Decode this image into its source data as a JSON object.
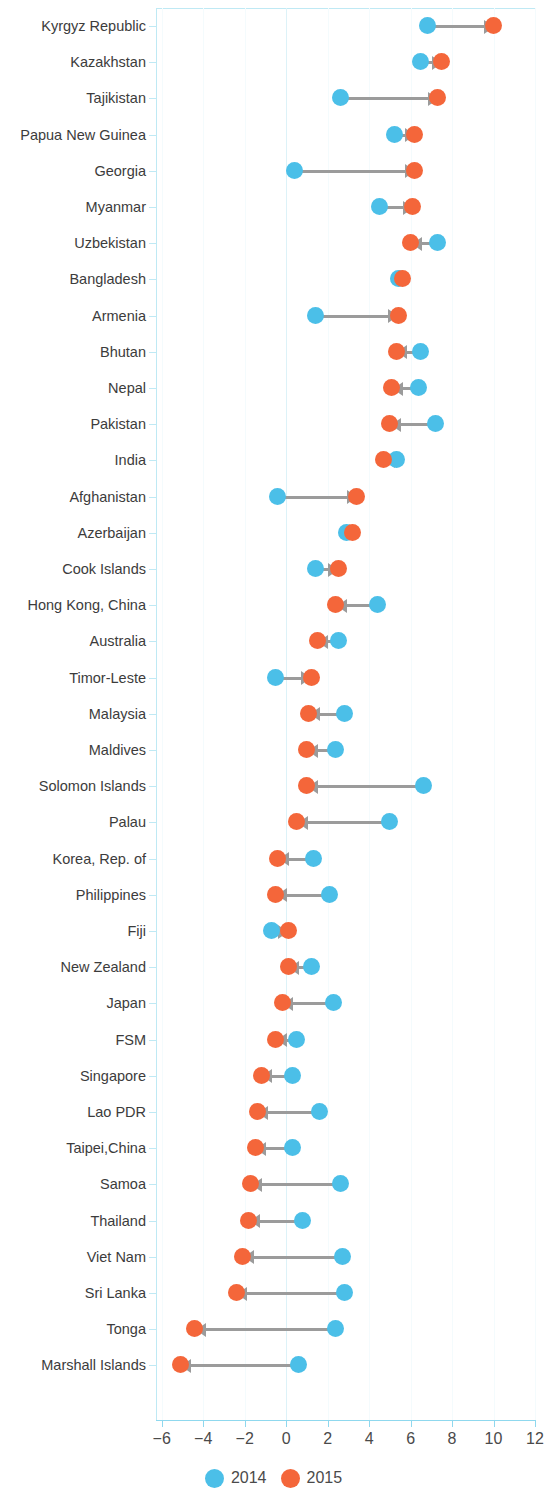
{
  "chart_data": {
    "type": "scatter",
    "subtype": "dumbbell-arrow-plot",
    "title": "",
    "xlabel": "",
    "ylabel": "",
    "xlim": [
      -6,
      12
    ],
    "xticks": [
      -6,
      -4,
      -2,
      0,
      2,
      4,
      6,
      8,
      10,
      12
    ],
    "xtick_labels": [
      "−6",
      "−4",
      "−2",
      "0",
      "2",
      "4",
      "6",
      "8",
      "10",
      "12"
    ],
    "grid": true,
    "legend_position": "bottom",
    "colors": {
      "2014": "#4bbfe8",
      "2015": "#f4663a",
      "arrow": "#9b9b9b",
      "axis": "#8fd8ee"
    },
    "legend": [
      {
        "label": "2014",
        "color": "#4bbfe8"
      },
      {
        "label": "2015",
        "color": "#f4663a"
      }
    ],
    "series": [
      {
        "name": "2014",
        "color": "#4bbfe8"
      },
      {
        "name": "2015",
        "color": "#f4663a"
      }
    ],
    "categories": [
      "Kyrgyz Republic",
      "Kazakhstan",
      "Tajikistan",
      "Papua New Guinea",
      "Georgia",
      "Myanmar",
      "Uzbekistan",
      "Bangladesh",
      "Armenia",
      "Bhutan",
      "Nepal",
      "Pakistan",
      "India",
      "Afghanistan",
      "Azerbaijan",
      "Cook Islands",
      "Hong Kong, China",
      "Australia",
      "Timor-Leste",
      "Malaysia",
      "Maldives",
      "Solomon Islands",
      "Palau",
      "Korea, Rep. of",
      "Philippines",
      "Fiji",
      "New Zealand",
      "Japan",
      "FSM",
      "Singapore",
      "Lao PDR",
      "Taipei,China",
      "Samoa",
      "Thailand",
      "Viet Nam",
      "Sri Lanka",
      "Tonga",
      "Marshall Islands"
    ],
    "points": [
      {
        "category": "Kyrgyz Republic",
        "v2014": 6.8,
        "v2015": 10.0
      },
      {
        "category": "Kazakhstan",
        "v2014": 6.5,
        "v2015": 7.5
      },
      {
        "category": "Tajikistan",
        "v2014": 2.6,
        "v2015": 7.3
      },
      {
        "category": "Papua New Guinea",
        "v2014": 5.2,
        "v2015": 6.2
      },
      {
        "category": "Georgia",
        "v2014": 0.4,
        "v2015": 6.2
      },
      {
        "category": "Myanmar",
        "v2014": 4.5,
        "v2015": 6.1
      },
      {
        "category": "Uzbekistan",
        "v2014": 7.3,
        "v2015": 6.0
      },
      {
        "category": "Bangladesh",
        "v2014": 5.4,
        "v2015": 5.6
      },
      {
        "category": "Armenia",
        "v2014": 1.4,
        "v2015": 5.4
      },
      {
        "category": "Bhutan",
        "v2014": 6.5,
        "v2015": 5.3
      },
      {
        "category": "Nepal",
        "v2014": 6.4,
        "v2015": 5.1
      },
      {
        "category": "Pakistan",
        "v2014": 7.2,
        "v2015": 5.0
      },
      {
        "category": "India",
        "v2014": 5.3,
        "v2015": 4.7
      },
      {
        "category": "Afghanistan",
        "v2014": -0.4,
        "v2015": 3.4
      },
      {
        "category": "Azerbaijan",
        "v2014": 2.9,
        "v2015": 3.2
      },
      {
        "category": "Cook Islands",
        "v2014": 1.4,
        "v2015": 2.5
      },
      {
        "category": "Hong Kong, China",
        "v2014": 4.4,
        "v2015": 2.4
      },
      {
        "category": "Australia",
        "v2014": 2.5,
        "v2015": 1.5
      },
      {
        "category": "Timor-Leste",
        "v2014": -0.5,
        "v2015": 1.2
      },
      {
        "category": "Malaysia",
        "v2014": 2.8,
        "v2015": 1.1
      },
      {
        "category": "Maldives",
        "v2014": 2.4,
        "v2015": 1.0
      },
      {
        "category": "Solomon Islands",
        "v2014": 6.6,
        "v2015": 1.0
      },
      {
        "category": "Palau",
        "v2014": 5.0,
        "v2015": 0.5
      },
      {
        "category": "Korea, Rep. of",
        "v2014": 1.3,
        "v2015": -0.4
      },
      {
        "category": "Philippines",
        "v2014": 2.1,
        "v2015": -0.5
      },
      {
        "category": "Fiji",
        "v2014": -0.7,
        "v2015": 0.1
      },
      {
        "category": "New Zealand",
        "v2014": 1.2,
        "v2015": 0.1
      },
      {
        "category": "Japan",
        "v2014": 2.3,
        "v2015": -0.2
      },
      {
        "category": "FSM",
        "v2014": 0.5,
        "v2015": -0.5
      },
      {
        "category": "Singapore",
        "v2014": 0.3,
        "v2015": -1.2
      },
      {
        "category": "Lao PDR",
        "v2014": 1.6,
        "v2015": -1.4
      },
      {
        "category": "Taipei,China",
        "v2014": 0.3,
        "v2015": -1.5
      },
      {
        "category": "Samoa",
        "v2014": 2.6,
        "v2015": -1.7
      },
      {
        "category": "Thailand",
        "v2014": 0.8,
        "v2015": -1.8
      },
      {
        "category": "Viet Nam",
        "v2014": 2.7,
        "v2015": -2.1
      },
      {
        "category": "Sri Lanka",
        "v2014": 2.8,
        "v2015": -2.4
      },
      {
        "category": "Tonga",
        "v2014": 2.4,
        "v2015": -4.4
      },
      {
        "category": "Marshall Islands",
        "v2014": 0.6,
        "v2015": -5.1
      }
    ]
  }
}
